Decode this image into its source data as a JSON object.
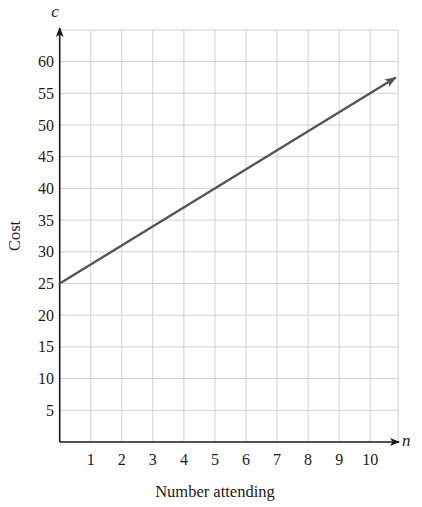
{
  "chart_data": {
    "type": "line",
    "title": "",
    "xlabel": "Number attending",
    "ylabel": "Cost",
    "x_variable": "n",
    "y_variable": "c",
    "x_ticks": [
      1,
      2,
      3,
      4,
      5,
      6,
      7,
      8,
      9,
      10
    ],
    "y_ticks": [
      5,
      10,
      15,
      20,
      25,
      30,
      35,
      40,
      45,
      50,
      55,
      60
    ],
    "xlim": [
      0,
      10.9
    ],
    "ylim": [
      0,
      64
    ],
    "grid": true,
    "legend": null,
    "series": [
      {
        "name": "c = 25 + 3n",
        "equation": "c = 25 + 3n",
        "x": [
          0,
          10.8
        ],
        "values": [
          25,
          57.4
        ],
        "color": "#555555",
        "arrow_end": true
      }
    ]
  },
  "colors": {
    "axis": "#1a1a1a",
    "grid": "#cfcfcf",
    "line": "#555555",
    "background": "#ffffff"
  }
}
